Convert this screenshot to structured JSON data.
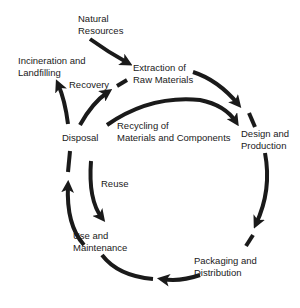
{
  "diagram": {
    "type": "product-life-cycle",
    "stroke_color": "#1a1a1a",
    "nodes": {
      "natural_resources": {
        "line1": "Natural",
        "line2": "Resources"
      },
      "extraction": {
        "line1": "Extraction of",
        "line2": "Raw Materials"
      },
      "design": {
        "line1": "Design and",
        "line2": "Production"
      },
      "packaging": {
        "line1": "Packaging and",
        "line2": "Distribution"
      },
      "use": {
        "line1": "Use and",
        "line2": "Maintenance"
      },
      "disposal": {
        "line1": "Disposal"
      },
      "incineration": {
        "line1": "Incineration and",
        "line2": "Landfilling"
      }
    },
    "edge_labels": {
      "recovery": "Recovery",
      "recycling": {
        "line1": "Recycling of",
        "line2": "Materials and Components"
      },
      "reuse": "Reuse"
    },
    "edges": [
      {
        "from": "Natural Resources",
        "to": "Extraction of Raw Materials"
      },
      {
        "from": "Extraction of Raw Materials",
        "to": "Design and Production"
      },
      {
        "from": "Design and Production",
        "to": "Packaging and Distribution"
      },
      {
        "from": "Packaging and Distribution",
        "to": "Use and Maintenance"
      },
      {
        "from": "Use and Maintenance",
        "to": "Disposal"
      },
      {
        "from": "Disposal",
        "to": "Incineration and Landfilling"
      },
      {
        "from": "Disposal",
        "to": "Extraction of Raw Materials",
        "label": "Recovery"
      },
      {
        "from": "Disposal",
        "to": "Design and Production",
        "label": "Recycling of Materials and Components"
      },
      {
        "from": "Disposal",
        "to": "Use and Maintenance",
        "label": "Reuse"
      }
    ]
  }
}
